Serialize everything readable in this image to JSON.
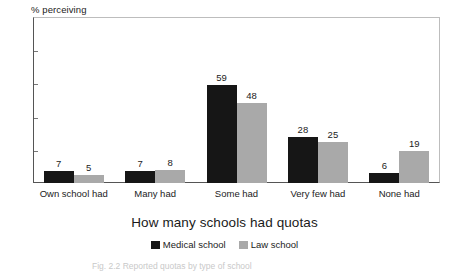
{
  "chart_data": {
    "type": "bar",
    "title": "",
    "xlabel": "How many schools had quotas",
    "ylabel": "% perceiving",
    "ylim": [
      0,
      100
    ],
    "yticks": [
      0,
      20,
      40,
      60,
      80,
      100
    ],
    "grid": false,
    "legend_position": "bottom",
    "categories": [
      "Own school had",
      "Many had",
      "Some had",
      "Very few had",
      "None had"
    ],
    "series": [
      {
        "name": "Medical school",
        "color": "#161616",
        "values": [
          7,
          7,
          59,
          28,
          6
        ]
      },
      {
        "name": "Law school",
        "color": "#a9a9a9",
        "values": [
          5,
          8,
          48,
          25,
          19
        ]
      }
    ]
  },
  "caption": {
    "text": "Fig. 2.2 Reported quotas by type of school"
  }
}
